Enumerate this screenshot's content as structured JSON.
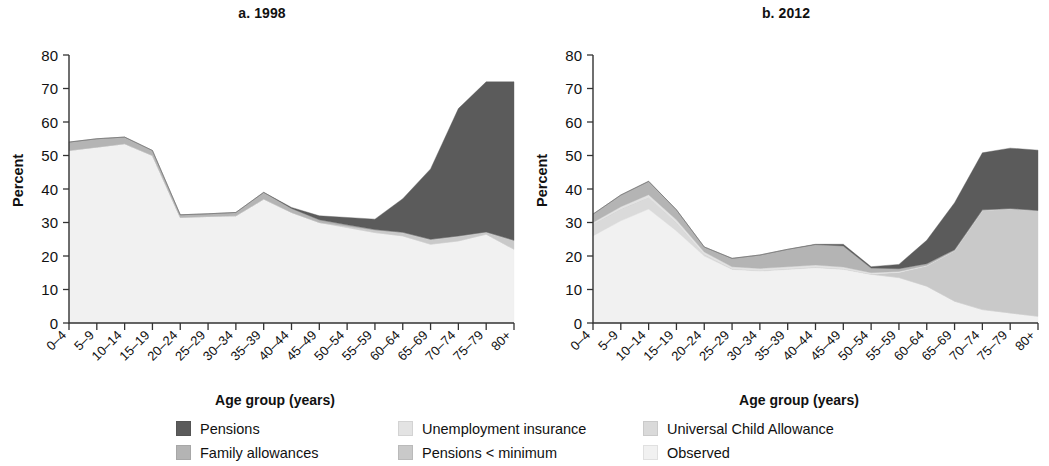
{
  "figure": {
    "xlabel": "Age group (years)",
    "ylabel": "Percent"
  },
  "legend": {
    "columns": [
      [
        {
          "label": "Pensions",
          "color": "#5b5b5b",
          "key": "pensions"
        },
        {
          "label": "Family allowances",
          "color": "#b4b4b4",
          "key": "family_allowances"
        }
      ],
      [
        {
          "label": "Unemployment insurance",
          "color": "#e3e3e3",
          "key": "unemployment_insurance"
        },
        {
          "label": "Pensions < minimum",
          "color": "#c9c9c9",
          "key": "pensions_below_minimum"
        }
      ],
      [
        {
          "label": "Universal Child Allowance",
          "color": "#dadada",
          "key": "universal_child_allowance"
        },
        {
          "label": "Observed",
          "color": "#f1f1f1",
          "key": "observed"
        }
      ]
    ]
  },
  "chart_data": [
    {
      "type": "area",
      "stacked": true,
      "title": "a. 1998",
      "xlabel": "Age group (years)",
      "ylabel": "Percent",
      "ylim": [
        0,
        80
      ],
      "yticks": [
        0,
        10,
        20,
        30,
        40,
        50,
        60,
        70,
        80
      ],
      "grid": false,
      "legend_position": "bottom",
      "categories": [
        "0–4",
        "5–9",
        "10–14",
        "15–19",
        "20–24",
        "25–29",
        "30–34",
        "35–39",
        "40–44",
        "45–49",
        "50–54",
        "55–59",
        "60–64",
        "65–69",
        "70–74",
        "75–79",
        "80+"
      ],
      "series": [
        {
          "name": "Observed",
          "color": "#f1f1f1",
          "values": [
            51.5,
            52.5,
            53.5,
            50.0,
            31.5,
            31.8,
            32.0,
            37.0,
            33.0,
            30.0,
            28.5,
            27.0,
            26.0,
            23.5,
            24.5,
            26.5,
            22.0
          ]
        },
        {
          "name": "Universal Child Allowance",
          "color": "#dadada",
          "values": [
            0.0,
            0.0,
            0.0,
            0.0,
            0.0,
            0.0,
            0.0,
            0.0,
            0.0,
            0.0,
            0.0,
            0.0,
            0.0,
            0.0,
            0.0,
            0.0,
            0.0
          ]
        },
        {
          "name": "Pensions < minimum",
          "color": "#c9c9c9",
          "values": [
            0.0,
            0.0,
            0.0,
            0.0,
            0.0,
            0.0,
            0.0,
            0.0,
            0.0,
            0.0,
            0.3,
            0.6,
            0.9,
            1.3,
            1.3,
            0.5,
            2.5
          ]
        },
        {
          "name": "Unemployment insurance",
          "color": "#e3e3e3",
          "values": [
            0.0,
            0.0,
            0.0,
            0.0,
            0.0,
            0.0,
            0.0,
            0.0,
            0.0,
            0.0,
            0.0,
            0.0,
            0.0,
            0.0,
            0.0,
            0.0,
            0.0
          ]
        },
        {
          "name": "Family allowances",
          "color": "#b4b4b4",
          "values": [
            2.5,
            2.5,
            2.0,
            1.5,
            0.8,
            0.8,
            1.0,
            2.0,
            1.2,
            0.8,
            0.5,
            0.3,
            0.2,
            0.2,
            0.2,
            0.2,
            0.2
          ]
        },
        {
          "name": "Pensions",
          "color": "#5b5b5b",
          "values": [
            0.0,
            0.0,
            0.0,
            0.0,
            0.0,
            0.0,
            0.0,
            0.0,
            0.3,
            1.2,
            2.2,
            3.1,
            10.0,
            21.0,
            38.0,
            44.8,
            47.3
          ]
        }
      ],
      "totals": [
        54.0,
        55.0,
        55.5,
        51.5,
        32.3,
        32.6,
        33.0,
        39.0,
        34.5,
        32.0,
        31.5,
        31.0,
        37.1,
        46.0,
        64.0,
        72.0,
        72.0
      ]
    },
    {
      "type": "area",
      "stacked": true,
      "title": "b. 2012",
      "xlabel": "Age group (years)",
      "ylabel": "Percent",
      "ylim": [
        0,
        80
      ],
      "yticks": [
        0,
        10,
        20,
        30,
        40,
        50,
        60,
        70,
        80
      ],
      "grid": false,
      "legend_position": "bottom",
      "categories": [
        "0–4",
        "5–9",
        "10–14",
        "15–19",
        "20–24",
        "25–29",
        "30–34",
        "35–39",
        "40–44",
        "45–49",
        "50–54",
        "55–59",
        "60–64",
        "65–69",
        "70–74",
        "75–79",
        "80+"
      ],
      "series": [
        {
          "name": "Observed",
          "color": "#f1f1f1",
          "values": [
            26.0,
            30.5,
            34.0,
            27.5,
            20.0,
            16.0,
            15.5,
            16.0,
            16.5,
            16.0,
            14.5,
            13.5,
            11.0,
            6.5,
            4.0,
            3.0,
            2.0
          ]
        },
        {
          "name": "Universal Child Allowance",
          "color": "#dadada",
          "values": [
            3.5,
            3.5,
            3.5,
            2.5,
            0.5,
            0.2,
            0.2,
            0.2,
            0.2,
            0.2,
            0.1,
            0.1,
            0.0,
            0.0,
            0.0,
            0.0,
            0.0
          ]
        },
        {
          "name": "Pensions < minimum",
          "color": "#c9c9c9",
          "values": [
            0.0,
            0.0,
            0.0,
            0.0,
            0.0,
            0.0,
            0.0,
            0.0,
            0.0,
            0.0,
            0.0,
            1.5,
            6.0,
            15.0,
            29.5,
            31.0,
            31.5
          ]
        },
        {
          "name": "Unemployment insurance",
          "color": "#e3e3e3",
          "values": [
            0.5,
            0.7,
            0.8,
            0.8,
            0.7,
            0.6,
            0.6,
            0.6,
            0.6,
            0.5,
            0.4,
            0.3,
            0.2,
            0.1,
            0.1,
            0.0,
            0.0
          ]
        },
        {
          "name": "Family allowances",
          "color": "#b4b4b4",
          "values": [
            2.5,
            3.5,
            4.0,
            3.0,
            1.5,
            2.5,
            4.0,
            5.2,
            6.1,
            6.3,
            1.4,
            0.8,
            0.5,
            0.3,
            0.2,
            0.2,
            0.1
          ]
        },
        {
          "name": "Pensions",
          "color": "#5b5b5b",
          "values": [
            0.0,
            0.0,
            0.0,
            0.0,
            0.0,
            0.0,
            0.0,
            0.0,
            0.1,
            0.5,
            0.4,
            1.3,
            7.0,
            14.0,
            17.0,
            18.0,
            18.0
          ]
        }
      ],
      "totals": [
        32.5,
        38.2,
        42.3,
        33.8,
        22.7,
        19.3,
        20.3,
        22.0,
        23.5,
        23.5,
        16.8,
        17.5,
        24.7,
        35.9,
        50.8,
        52.2,
        51.6
      ]
    }
  ]
}
